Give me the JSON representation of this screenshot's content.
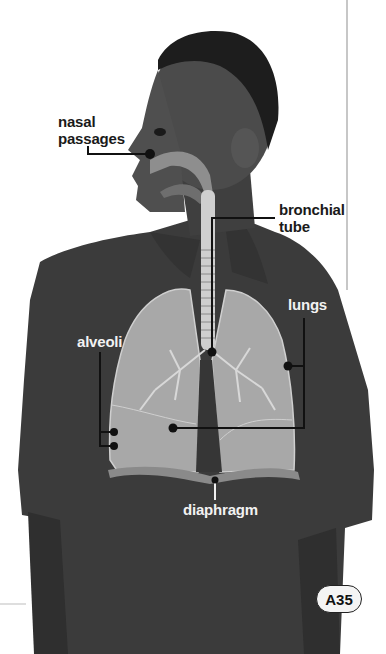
{
  "figure": {
    "colors": {
      "background": "#ffffff",
      "shirt": "#3a3a3a",
      "skin": "#4a4a4a",
      "hair": "#1c1c1c",
      "lungs": "#a9a9a9",
      "airway": "#8c8c8c",
      "leader_line": "#111111"
    }
  },
  "labels": {
    "nasal_passages": {
      "line1": "nasal",
      "line2": "passages"
    },
    "bronchial_tube": {
      "line1": "bronchial",
      "line2": "tube"
    },
    "lungs": "lungs",
    "alveoli": "alveoli",
    "diaphragm": "diaphragm"
  },
  "page": {
    "number": "A35"
  }
}
